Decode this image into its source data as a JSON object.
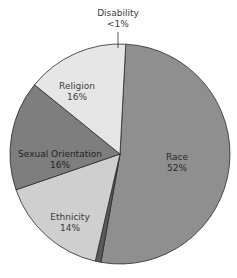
{
  "chart_data": {
    "type": "pie",
    "title": "",
    "categories": [
      "Race",
      "Disability",
      "Religion",
      "Sexual Orientation",
      "Ethnicity"
    ],
    "values": [
      52,
      1,
      16,
      16,
      14
    ],
    "value_labels": [
      "52%",
      "<1%",
      "16%",
      "16%",
      "14%"
    ],
    "colors": [
      "#8f8f8f",
      "#5a5a5a",
      "#cfcfcf",
      "#7e7e7e",
      "#e6e6e6"
    ],
    "start_angle_deg": 0,
    "direction": "clockwise",
    "legend": "none (inline labels)"
  },
  "labels": [
    {
      "name": "Disability",
      "value": "<1%",
      "x": 118,
      "y": 8
    },
    {
      "name": "Religion",
      "value": "16%",
      "x": 77,
      "y": 81
    },
    {
      "name": "Sexual Orientation",
      "value": "16%",
      "x": 60,
      "y": 149
    },
    {
      "name": "Race",
      "value": "52%",
      "x": 177,
      "y": 152
    },
    {
      "name": "Ethnicity",
      "value": "14%",
      "x": 70,
      "y": 212
    }
  ]
}
